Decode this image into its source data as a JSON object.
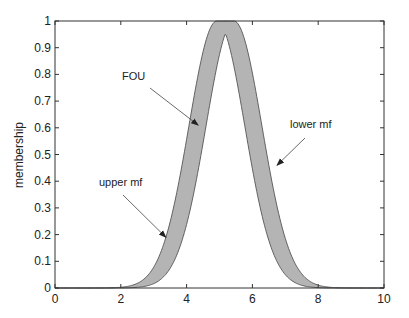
{
  "chart_data": {
    "type": "area",
    "title": "",
    "xlabel": "",
    "ylabel": "membership",
    "xlim": [
      0,
      10
    ],
    "ylim": [
      0,
      1
    ],
    "x_ticks": [
      0,
      2,
      4,
      6,
      8,
      10
    ],
    "x_tick_labels": [
      "0",
      "2",
      "4",
      "6",
      "8",
      "10"
    ],
    "y_ticks": [
      0,
      0.1,
      0.2,
      0.3,
      0.4,
      0.5,
      0.6,
      0.7,
      0.8,
      0.9,
      1
    ],
    "y_tick_labels": [
      "0",
      "0.1",
      "0.2",
      "0.3",
      "0.4",
      "0.5",
      "0.6",
      "0.7",
      "0.8",
      "0.9",
      "1"
    ],
    "grid": false,
    "legend": null,
    "mf_model": {
      "kind": "gaussian_uncertain_mean",
      "mean_1": 4.92,
      "mean_2": 5.44,
      "sigma": 0.85
    },
    "series": [
      {
        "name": "upper mf",
        "x": [
          0,
          1,
          2,
          3,
          3.5,
          4,
          4.5,
          4.92,
          5.44,
          6,
          6.5,
          7,
          7.5,
          8,
          9,
          10
        ],
        "values": [
          0.0,
          0.0003,
          0.003,
          0.028,
          0.075,
          0.557,
          0.885,
          1.0,
          1.0,
          0.804,
          0.537,
          0.26,
          0.091,
          0.021,
          0.0,
          0.0
        ]
      },
      {
        "name": "lower mf",
        "x": [
          0,
          1,
          2,
          3,
          4,
          4.5,
          5,
          5.18,
          5.5,
          6,
          6.5,
          7,
          8,
          9,
          10
        ],
        "values": [
          0.0,
          0.0,
          0.0,
          0.006,
          0.18,
          0.373,
          0.862,
          0.954,
          0.855,
          0.557,
          0.27,
          0.1,
          0.003,
          0.0,
          0.0
        ]
      }
    ],
    "fill_between": "upper mf / lower mf",
    "annotations": [
      {
        "text": "FOU",
        "arrow_to": [
          4.35,
          0.61
        ]
      },
      {
        "text": "lower mf",
        "arrow_to": [
          6.75,
          0.46
        ]
      },
      {
        "text": "upper mf",
        "arrow_to": [
          3.37,
          0.19
        ]
      }
    ]
  },
  "colors": {
    "fou_fill": "#b4b4b4",
    "edge": "#555555",
    "axis": "#333333"
  }
}
